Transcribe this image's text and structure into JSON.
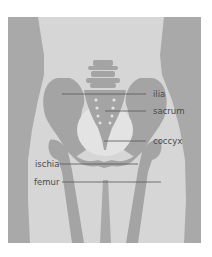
{
  "figure": {
    "colors": {
      "background": "#ffffff",
      "body_outer": "#a9a9a9",
      "body_inner": "#d6d6d6",
      "bone": "#a4a4a4",
      "bone_light": "#e3e3e3",
      "leader": "#555555",
      "label_text": "#4a4a4a"
    },
    "labels": [
      {
        "id": "ilia",
        "text": "ilia"
      },
      {
        "id": "sacrum",
        "text": "sacrum"
      },
      {
        "id": "coccyx",
        "text": "coccyx"
      },
      {
        "id": "ischia",
        "text": "ischia"
      },
      {
        "id": "femur",
        "text": "femur"
      }
    ]
  }
}
